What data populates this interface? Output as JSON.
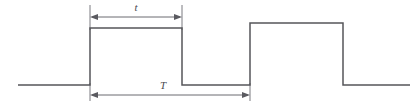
{
  "figure": {
    "background_color": "#ffffff",
    "waveform_color": "#55555a",
    "dimension_color": "#6a6a70",
    "label_color": "#4a4a50",
    "labels": {
      "pulse_width": "t",
      "period": "T"
    },
    "geometry": {
      "baseline_y": 85,
      "pulse1_top_y": 28,
      "pulse2_top_y": 23,
      "baseline_start_x": 18,
      "pulse1_rise_x": 90,
      "pulse1_fall_x": 182,
      "pulse2_rise_x": 250,
      "pulse2_fall_x": 343,
      "baseline_end_x": 410,
      "t_arrow_y": 17,
      "t_arrow_x1": 90,
      "t_arrow_x2": 182,
      "T_arrow_y": 95,
      "T_arrow_x1": 90,
      "T_arrow_x2": 250
    }
  }
}
